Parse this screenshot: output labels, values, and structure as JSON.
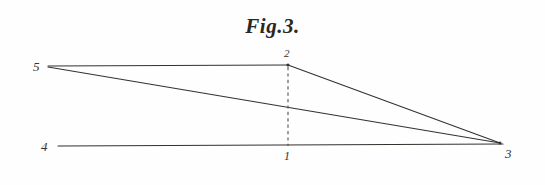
{
  "figure": {
    "title": "Fig.3.",
    "background_color": "#fefefe",
    "ink_color": "#35312d",
    "width": 545,
    "height": 185
  },
  "chart_data": {
    "type": "diagram",
    "title": "Fig.3.",
    "subtitle": "",
    "xlabel": "",
    "ylabel": "",
    "grid": false,
    "legend": "none",
    "points": [
      {
        "label": "5",
        "x": 48,
        "y": 66,
        "label_x": 36,
        "label_y": 68,
        "label_position": "left"
      },
      {
        "label": "2",
        "x": 288,
        "y": 65,
        "label_x": 288,
        "label_y": 54,
        "label_position": "above"
      },
      {
        "label": "4",
        "x": 58,
        "y": 146,
        "label_x": 46,
        "label_y": 148,
        "label_position": "left"
      },
      {
        "label": "1",
        "x": 288,
        "y": 146,
        "label_x": 288,
        "label_y": 157,
        "label_position": "below"
      },
      {
        "label": "3",
        "x": 500,
        "y": 143,
        "label_x": 510,
        "label_y": 154,
        "label_position": "right-below"
      }
    ],
    "segments": [
      {
        "name": "segment-5-2",
        "from": "5",
        "to": "2",
        "style": "solid",
        "x1": 48,
        "y1": 66,
        "x2": 288,
        "y2": 65
      },
      {
        "name": "segment-2-3",
        "from": "2",
        "to": "3",
        "style": "solid",
        "x1": 288,
        "y1": 65,
        "x2": 500,
        "y2": 143
      },
      {
        "name": "segment-5-3",
        "from": "5",
        "to": "3",
        "style": "solid",
        "x1": 48,
        "y1": 67,
        "x2": 500,
        "y2": 143
      },
      {
        "name": "baseline-4-3",
        "from": "4",
        "to": "3",
        "style": "solid",
        "x1": 58,
        "y1": 146,
        "x2": 503,
        "y2": 144
      },
      {
        "name": "ordinate-2-1",
        "from": "2",
        "to": "1",
        "style": "dashed",
        "x1": 288,
        "y1": 67,
        "x2": 288,
        "y2": 146
      }
    ],
    "series": [
      {
        "name": "upper-triangle",
        "vertices": [
          "5",
          "2",
          "3"
        ],
        "values": [
          66,
          65,
          143
        ]
      },
      {
        "name": "base-triangle",
        "vertices": [
          "4",
          "1",
          "3"
        ],
        "values": [
          146,
          146,
          143
        ]
      }
    ],
    "xlim": [
      0,
      545
    ],
    "ylim": [
      0,
      185
    ]
  }
}
